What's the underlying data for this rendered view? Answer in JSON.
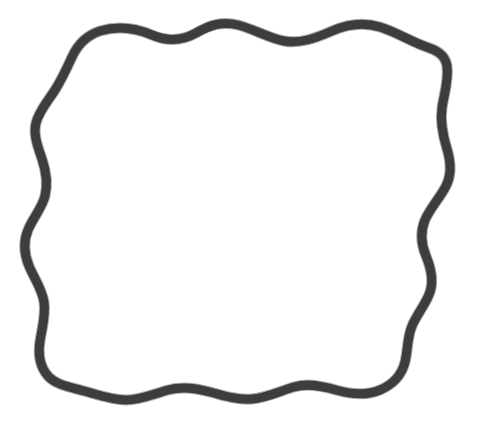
{
  "canvas": {
    "width": 481,
    "height": 433,
    "background_color": "#ffffff"
  },
  "figure": {
    "name": "wavy-square-outline",
    "stroke_color": "#333333",
    "stroke_color_soft": "#4a4a4a",
    "stroke_width": 9,
    "stroke_width_soft": 11,
    "fill": "none",
    "closed": true,
    "bounds": {
      "x_min": 23,
      "y_min": 22,
      "x_max": 452,
      "y_max": 402
    },
    "path": "M 100 31 C 120 25 138 29 152 35 C 166 41 180 42 196 33 C 210 25 222 21 238 25 C 254 29 268 38 284 41 C 300 44 316 38 332 31 C 348 24 364 22 380 27 C 396 32 410 41 424 46 C 436 50 445 54 447 66 C 449 80 444 94 442 108 C 440 122 443 136 447 149 C 451 162 452 174 446 186 C 440 198 430 208 425 220 C 420 232 421 244 426 256 C 431 268 434 280 430 292 C 426 304 417 314 412 326 C 407 338 408 350 405 362 C 402 374 394 384 380 390 C 366 396 350 394 336 390 C 322 386 308 383 294 387 C 280 391 266 398 252 399 C 238 400 224 396 210 392 C 196 388 182 386 168 390 C 154 394 140 400 126 400 C 112 400 98 395 84 391 C 70 387 56 385 48 376 C 40 367 38 354 40 341 C 42 328 46 315 44 302 C 42 289 34 278 29 266 C 24 254 23 242 28 230 C 33 218 42 208 45 196 C 48 184 46 171 42 159 C 38 147 33 135 36 123 C 39 111 48 101 55 90 C 62 79 67 68 72 57 C 77 46 85 36 100 31 Z"
  }
}
